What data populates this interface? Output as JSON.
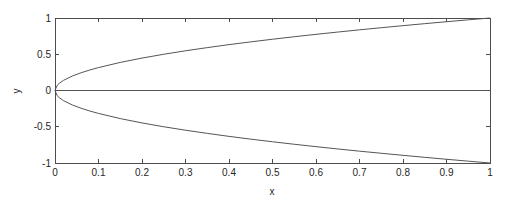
{
  "chart_data": {
    "type": "line",
    "title": "",
    "xlabel": "x",
    "ylabel": "y",
    "xlim": [
      0,
      1
    ],
    "ylim": [
      -1,
      1
    ],
    "grid": false,
    "legend": null,
    "xticks": [
      0,
      0.1,
      0.2,
      0.3,
      0.4,
      0.5,
      0.6,
      0.7,
      0.8,
      0.9,
      1
    ],
    "xtick_labels": [
      "0",
      "0.1",
      "0.2",
      "0.3",
      "0.4",
      "0.5",
      "0.6",
      "0.7",
      "0.8",
      "0.9",
      "1"
    ],
    "yticks": [
      -1,
      -0.5,
      0,
      0.5,
      1
    ],
    "ytick_labels": [
      "-1",
      "-0.5",
      "0",
      "0.5",
      "1"
    ],
    "series": [
      {
        "name": "upper branch (y = sqrt(x))",
        "color": "#555555",
        "x": [
          0,
          0.005,
          0.01,
          0.02,
          0.04,
          0.06,
          0.08,
          0.1,
          0.15,
          0.2,
          0.25,
          0.3,
          0.35,
          0.4,
          0.45,
          0.5,
          0.55,
          0.6,
          0.65,
          0.7,
          0.75,
          0.8,
          0.85,
          0.9,
          0.95,
          1
        ],
        "y": [
          0,
          0.0707,
          0.1,
          0.1414,
          0.2,
          0.2449,
          0.2828,
          0.3162,
          0.3873,
          0.4472,
          0.5,
          0.5477,
          0.5916,
          0.6325,
          0.6708,
          0.7071,
          0.7416,
          0.7746,
          0.8062,
          0.8367,
          0.866,
          0.8944,
          0.922,
          0.9487,
          0.9747,
          1
        ]
      },
      {
        "name": "lower branch (y = -sqrt(x))",
        "color": "#555555",
        "x": [
          0,
          0.005,
          0.01,
          0.02,
          0.04,
          0.06,
          0.08,
          0.1,
          0.15,
          0.2,
          0.25,
          0.3,
          0.35,
          0.4,
          0.45,
          0.5,
          0.55,
          0.6,
          0.65,
          0.7,
          0.75,
          0.8,
          0.85,
          0.9,
          0.95,
          1
        ],
        "y": [
          0,
          -0.0707,
          -0.1,
          -0.1414,
          -0.2,
          -0.2449,
          -0.2828,
          -0.3162,
          -0.3873,
          -0.4472,
          -0.5,
          -0.5477,
          -0.5916,
          -0.6325,
          -0.6708,
          -0.7071,
          -0.7416,
          -0.7746,
          -0.8062,
          -0.8367,
          -0.866,
          -0.8944,
          -0.922,
          -0.9487,
          -0.9747,
          -1
        ]
      },
      {
        "name": "horizontal line (y = 0)",
        "color": "#555555",
        "x": [
          0,
          1
        ],
        "y": [
          0,
          0
        ]
      }
    ]
  },
  "colors": {
    "axis": "#4d4d4d",
    "tick_text": "#262626",
    "background": "#ffffff"
  }
}
